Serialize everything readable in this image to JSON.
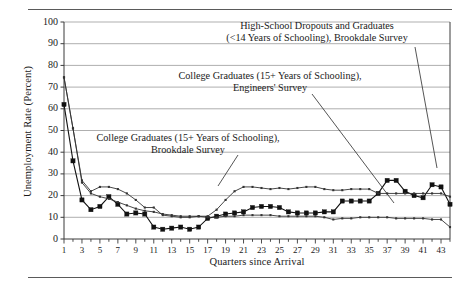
{
  "figure": {
    "rule_color": "#5a5a5a",
    "background": "#ffffff"
  },
  "chart_data": {
    "type": "line",
    "title": "",
    "xlabel": "Quarters since Arrival",
    "ylabel": "Unemployment Rate (Percent)",
    "xlim": [
      1,
      44
    ],
    "ylim": [
      0,
      100
    ],
    "yticks": [
      0,
      10,
      20,
      30,
      40,
      50,
      60,
      70,
      80,
      90,
      100
    ],
    "ytick_labels": [
      "0",
      "10",
      "20",
      "30",
      "40",
      "50",
      "60",
      "70",
      "80",
      "90",
      "100"
    ],
    "xticks": [
      1,
      3,
      5,
      7,
      9,
      11,
      13,
      15,
      17,
      19,
      21,
      23,
      25,
      27,
      29,
      31,
      33,
      35,
      37,
      39,
      41,
      43
    ],
    "xtick_labels": [
      "1",
      "3",
      "5",
      "7",
      "9",
      "11",
      "13",
      "15",
      "17",
      "19",
      "21",
      "23",
      "25",
      "27",
      "29",
      "31",
      "33",
      "35",
      "37",
      "39",
      "41",
      "43"
    ],
    "grid": "horizontal",
    "legend_position": "annotations",
    "x": [
      1,
      2,
      3,
      4,
      5,
      6,
      7,
      8,
      9,
      10,
      11,
      12,
      13,
      14,
      15,
      16,
      17,
      18,
      19,
      20,
      21,
      22,
      23,
      24,
      25,
      26,
      27,
      28,
      29,
      30,
      31,
      32,
      33,
      34,
      35,
      36,
      37,
      38,
      39,
      40,
      41,
      42,
      43,
      44
    ],
    "series": [
      {
        "name": "High-School Dropouts and Graduates (<14 Years of Schooling), Brookdale Survey",
        "marker": "square-filled",
        "color": "#111111",
        "values": [
          62,
          36,
          18,
          13.5,
          15,
          19.5,
          16,
          11.5,
          12,
          11.5,
          5.5,
          4.5,
          5,
          5.5,
          4.5,
          5.5,
          9.5,
          10.5,
          11.5,
          12,
          12.5,
          14.5,
          15,
          15,
          14.5,
          12.5,
          12,
          12,
          12,
          12.5,
          12.5,
          17.5,
          17.5,
          17.5,
          17.5,
          21,
          27,
          27,
          22,
          20,
          19,
          25,
          24,
          16
        ]
      },
      {
        "name": "College Graduates (15+ Years of Schooling), Engineers' Survey",
        "marker": "dot-small",
        "color": "#333333",
        "values": [
          74.5,
          51,
          26,
          21,
          19.5,
          18.5,
          17,
          15.5,
          14,
          13,
          12.5,
          11.5,
          11,
          10.5,
          10.5,
          10.5,
          10,
          10,
          10.5,
          10.5,
          11,
          11,
          11,
          11,
          10.5,
          10.5,
          10.5,
          10.5,
          10.5,
          10,
          9,
          9.5,
          9.5,
          10,
          10,
          10,
          10,
          9.5,
          9.5,
          9.5,
          9.5,
          9,
          9,
          5.5
        ]
      },
      {
        "name": "College Graduates (15+ Years of Schooling), Brookdale Survey",
        "marker": "dot-small",
        "color": "#333333",
        "values": [
          74.5,
          51,
          27,
          22,
          24,
          24,
          23,
          21,
          18,
          14.5,
          14.5,
          11,
          10.5,
          10,
          10,
          10.5,
          10.5,
          13.5,
          18,
          22,
          24,
          24,
          23.5,
          23,
          23.5,
          23,
          23.5,
          24,
          24,
          23,
          22.5,
          22.5,
          23,
          23,
          23,
          21,
          21,
          21,
          21,
          21,
          21,
          21,
          21,
          19.5
        ]
      }
    ],
    "annotations": [
      {
        "id": "annot-0",
        "lines": [
          "High-School Dropouts and Graduates",
          "(<14 Years of Schooling), Brookdale Survey"
        ],
        "leader_from": [
          415,
          47
        ],
        "leader_to": [
          437,
          168
        ]
      },
      {
        "id": "annot-1",
        "lines": [
          "College Graduates (15+ Years of Schooling),",
          "Engineers' Survey"
        ],
        "leader_from": [
          312,
          94
        ],
        "leader_to": [
          394,
          203
        ]
      },
      {
        "id": "annot-2",
        "lines": [
          "College Graduates (15+ Years of Schooling),",
          "Brookdale Survey"
        ],
        "leader_from": [
          238,
          155
        ],
        "leader_to": [
          218,
          186
        ]
      }
    ]
  }
}
